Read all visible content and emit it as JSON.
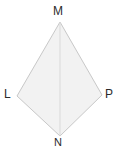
{
  "figure": {
    "type": "quadrilateral-kite-diagram",
    "background_color": "#ffffff",
    "fill_color": "#f2f2f2",
    "stroke_color": "#c8c8c8",
    "diagonal_color": "#d9d9d9",
    "label_color": "#2b2b2b",
    "outline_path": "60,22 17,96 60,136 102,95",
    "diagonal_path": "60,22 60,136",
    "vertices": [
      {
        "id": "M",
        "label": "M",
        "x": 60,
        "y": 22,
        "position": "top"
      },
      {
        "id": "L",
        "label": "L",
        "x": 17,
        "y": 96,
        "position": "left"
      },
      {
        "id": "P",
        "label": "P",
        "x": 102,
        "y": 95,
        "position": "right"
      },
      {
        "id": "N",
        "label": "N",
        "x": 60,
        "y": 136,
        "position": "bottom"
      }
    ]
  }
}
